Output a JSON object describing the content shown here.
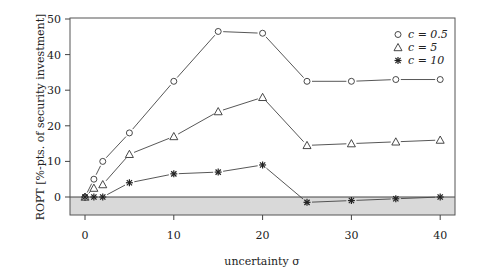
{
  "chart_data": {
    "type": "line",
    "title": "",
    "xlabel": "uncertainty σ",
    "ylabel": "ROPT [%-pts. of security investment]",
    "xlim": [
      -3,
      42.5
    ],
    "ylim": [
      -5.5,
      50
    ],
    "xticks": [
      0,
      10,
      20,
      30,
      40
    ],
    "yticks": [
      0,
      10,
      20,
      30,
      40,
      50
    ],
    "grid": false,
    "legend_position": "top-right",
    "negative_region_shaded": true,
    "shade_color": "#d9d9d9",
    "x": [
      0,
      1,
      2,
      5,
      10,
      15,
      20,
      25,
      30,
      35,
      40
    ],
    "series": [
      {
        "name": "c = 0.5",
        "marker": "circle",
        "values": [
          0,
          5,
          10,
          18,
          32.5,
          46.5,
          46,
          32.5,
          32.5,
          33,
          33
        ]
      },
      {
        "name": "c = 5",
        "marker": "triangle",
        "values": [
          0,
          2.5,
          3.5,
          12,
          17,
          24,
          28,
          14.5,
          15,
          15.5,
          16
        ]
      },
      {
        "name": "c = 10",
        "marker": "asterisk",
        "values": [
          0,
          0,
          0,
          4,
          6.5,
          7,
          9,
          -1.5,
          -1,
          -0.5,
          0
        ]
      }
    ]
  },
  "legend": {
    "items": [
      {
        "label": "c = 0.5"
      },
      {
        "label": "c = 5"
      },
      {
        "label": "c = 10"
      }
    ]
  }
}
